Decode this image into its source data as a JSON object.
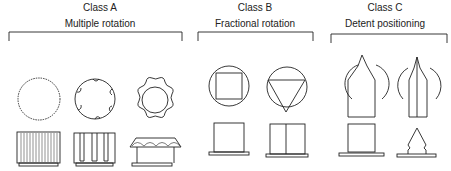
{
  "classes": [
    {
      "title": "Class A",
      "subtitle": "Multiple rotation",
      "items": [
        {
          "name": "fine-knurled-knob",
          "top_view": "fine serrated circle",
          "side_view": "cylinder with vertical ribs"
        },
        {
          "name": "scalloped-knob",
          "top_view": "circle with scalloped indents",
          "side_view": "cylinder with vertical flutes"
        },
        {
          "name": "lobed-knob",
          "top_view": "lobed outline with inner circle",
          "side_view": "domed cap on post"
        }
      ]
    },
    {
      "title": "Class B",
      "subtitle": "Fractional rotation",
      "items": [
        {
          "name": "square-insert-knob",
          "top_view": "circle with inscribed square",
          "side_view": "square body on base"
        },
        {
          "name": "triangle-insert-knob",
          "top_view": "circle with inscribed inverted triangle",
          "side_view": "split body on base"
        }
      ]
    },
    {
      "title": "Class C",
      "subtitle": "Detent positioning",
      "items": [
        {
          "name": "pointer-knob",
          "top_view": "circle with pointed bar",
          "side_view": "square body on base"
        },
        {
          "name": "ridged-pointer-knob",
          "top_view": "circle with ridged pointed bar",
          "side_view": "pointed tapered body on base"
        }
      ]
    }
  ]
}
